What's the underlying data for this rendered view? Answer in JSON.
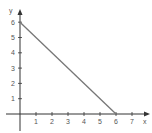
{
  "chart_data": {
    "type": "line",
    "title": "",
    "xlabel": "x",
    "ylabel": "y",
    "xlim": [
      0,
      7.5
    ],
    "ylim": [
      0,
      6.5
    ],
    "x_ticks": [
      1,
      2,
      3,
      4,
      5,
      6,
      7
    ],
    "y_ticks": [
      1,
      2,
      3,
      4,
      5,
      6
    ],
    "grid": false,
    "legend": null,
    "series": [
      {
        "name": "line",
        "x": [
          0,
          6
        ],
        "y": [
          6,
          0
        ]
      }
    ]
  },
  "colors": {
    "axis": "#333333",
    "line": "#777777",
    "text": "#555555"
  }
}
